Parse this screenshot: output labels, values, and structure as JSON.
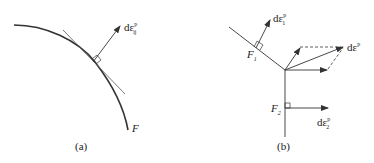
{
  "panel_a": {
    "surface_label": "F",
    "vector_label": "dε",
    "vector_sup": "p",
    "vector_sub": "ij",
    "caption": "(a)"
  },
  "panel_b": {
    "surface1_label": "F",
    "surface1_sub": "1",
    "surface2_label": "F",
    "surface2_sub": "2",
    "vector1_label": "dε",
    "vector1_sup": "p",
    "vector1_sub": "1",
    "vector2_label": "dε",
    "vector2_sup": "p",
    "vector2_sub": "2",
    "resultant_label": "dε",
    "resultant_sup": "p",
    "caption": "(b)"
  },
  "colors": {
    "line": "#333333",
    "background": "#ffffff"
  }
}
